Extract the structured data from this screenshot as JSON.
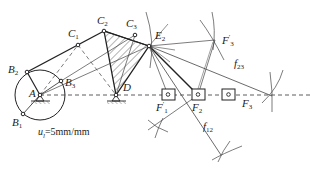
{
  "diagram": {
    "type": "mechanism-synthesis",
    "colors": {
      "stroke": "#222222",
      "hatch": "#444444",
      "background": "#ffffff"
    },
    "points": {
      "A": {
        "label": "A",
        "x": 40,
        "y": 95
      },
      "B1": {
        "label": "B",
        "sub": "1",
        "x": 23,
        "y": 114
      },
      "B2": {
        "label": "B",
        "sub": "2",
        "x": 27,
        "y": 72
      },
      "B3": {
        "label": "B",
        "sub": "3",
        "x": 61,
        "y": 81
      },
      "C1": {
        "label": "C",
        "sub": "1",
        "x": 78,
        "y": 45
      },
      "C2": {
        "label": "C",
        "sub": "2",
        "x": 104,
        "y": 31
      },
      "C3": {
        "label": "C",
        "sub": "3",
        "x": 135,
        "y": 35
      },
      "D": {
        "label": "D",
        "x": 116,
        "y": 95
      },
      "E2": {
        "label": "E",
        "sub": "2",
        "x": 149,
        "y": 46
      },
      "F1p": {
        "label": "F",
        "sup": "′",
        "sub": "1",
        "x": 168,
        "y": 95
      },
      "F2": {
        "label": "F",
        "sub": "2",
        "x": 198,
        "y": 95
      },
      "F3": {
        "label": "F",
        "sub": "3",
        "x": 229,
        "y": 95
      },
      "F3p": {
        "label": "F",
        "sup": "′",
        "sub": "3",
        "x": 215,
        "y": 40
      },
      "f23": {
        "label": "f",
        "sub": "23",
        "x": 272,
        "y": 96
      },
      "f12": {
        "label": "f",
        "sub": "12",
        "x": 221,
        "y": 155
      }
    },
    "labels": {
      "A": "A",
      "B1": "B",
      "B1_sub": "1",
      "B2": "B",
      "B2_sub": "2",
      "B3": "B",
      "B3_sub": "3",
      "C1": "C",
      "C1_sub": "1",
      "C2": "C",
      "C2_sub": "2",
      "C3": "C",
      "C3_sub": "3",
      "D": "D",
      "E2": "E",
      "E2_sub": "2",
      "F1p": "F",
      "F1p_sup": "′",
      "F1p_sub": "1",
      "F2": "F",
      "F2_sub": "2",
      "F3": "F",
      "F3_sub": "3",
      "F3p": "F",
      "F3p_sup": "′",
      "F3p_sub": "3",
      "f23": "f",
      "f23_sub": "23",
      "f12": "f",
      "f12_sub": "12"
    },
    "scale": {
      "symbol": "u",
      "sub": "l",
      "value": "=5mm/mm"
    },
    "crank_circle": {
      "center": "A",
      "radius": 25
    }
  }
}
